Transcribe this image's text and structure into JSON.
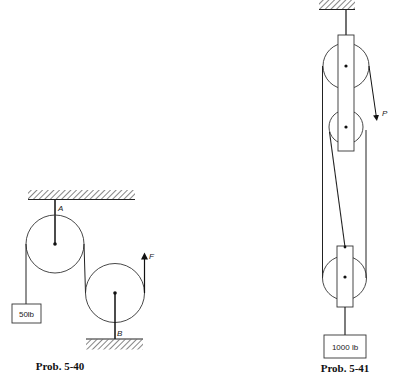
{
  "figure_1": {
    "caption": "Prob. 5-40",
    "labels": {
      "pulley_top": "A",
      "pulley_bottom": "B",
      "force": "F"
    },
    "weight_label": "50lb"
  },
  "figure_2": {
    "caption": "Prob. 5-41",
    "labels": {
      "force": "P"
    },
    "weight_label": "1000 lb"
  },
  "colors": {
    "line": "#222222",
    "background": "#ffffff"
  }
}
